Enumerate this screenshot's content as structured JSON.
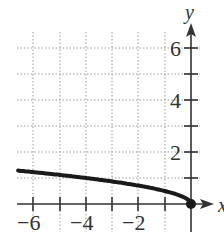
{
  "chart_data": {
    "type": "line",
    "title": "",
    "xlabel": "x",
    "ylabel": "y",
    "xlim": [
      -6.7,
      0.6
    ],
    "ylim": [
      -1.2,
      7.2
    ],
    "grid": true,
    "grid_style": "dotted",
    "x_ticks": [
      -6,
      -5,
      -4,
      -3,
      -2,
      -1
    ],
    "x_tick_labels": [
      "−6",
      "−4",
      "−2"
    ],
    "x_tick_label_values": [
      -6,
      -4,
      -2
    ],
    "y_ticks": [
      1,
      2,
      3,
      4,
      5,
      6
    ],
    "y_tick_labels": [
      "2",
      "4",
      "6"
    ],
    "y_tick_label_values": [
      2,
      4,
      6
    ],
    "series": [
      {
        "name": "y = sqrt(-x)",
        "x": [
          -6.6,
          -6,
          -5,
          -4,
          -3,
          -2,
          -1,
          -0.5,
          -0.1,
          0
        ],
        "y": [
          2.57,
          2.45,
          2.24,
          2.0,
          1.73,
          1.41,
          1.0,
          0.71,
          0.32,
          0
        ]
      }
    ],
    "points": [
      {
        "x": 0,
        "y": 0,
        "style": "filled"
      }
    ]
  },
  "labels": {
    "x_axis": "x",
    "y_axis": "y",
    "xt_m6": "−6",
    "xt_m4": "−4",
    "xt_m2": "−2",
    "yt_2": "2",
    "yt_4": "4",
    "yt_6": "6"
  }
}
